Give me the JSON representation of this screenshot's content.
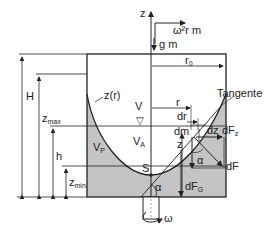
{
  "diagram": {
    "colors": {
      "fluid": "#c4c4c4",
      "line": "#222222",
      "background": "#ffffff"
    },
    "labels": {
      "z_axis": "z",
      "centrifugal": "ω²r m",
      "gravity": "g m",
      "r0": "r",
      "r0_sub": "0",
      "H": "H",
      "zmax": "z",
      "zmax_sub": "max",
      "h": "h",
      "zmin": "z",
      "zmin_sub": "min",
      "surface": "z(r)",
      "V": "V",
      "Vp": "V",
      "Vp_sub": "P",
      "VA": "V",
      "VA_sub": "A",
      "r": "r",
      "dr": "dr",
      "dm": "dm",
      "dz": "dz",
      "z_local": "z",
      "tangent": "Tangente",
      "dFz": "dF",
      "dFz_sub": "z",
      "dF": "dF",
      "alpha1": "α",
      "alpha2": "α",
      "dFG": "dF",
      "dFG_sub": "G",
      "S": "S",
      "omega": "ω",
      "water_level_symbol": "▽"
    }
  }
}
